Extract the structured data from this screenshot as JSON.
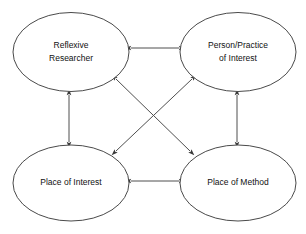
{
  "diagram": {
    "background_color": "#ffffff",
    "node_fill": "#ffffff",
    "node_stroke": "#4a4a4a",
    "connector_color": "#4f4f4f",
    "text_color": "#111111",
    "nodes": [
      {
        "id": "reflexive-researcher",
        "lines": [
          "Reflexive",
          "Researcher"
        ],
        "line1": "Reflexive",
        "line2": "Researcher",
        "cx": 71,
        "cy": 52,
        "rx": 58,
        "ry": 40
      },
      {
        "id": "person-practice-of-interest",
        "lines": [
          "Person/Practice",
          "of Interest"
        ],
        "line1": "Person/Practice",
        "line2": "of Interest",
        "cx": 238,
        "cy": 52,
        "rx": 58,
        "ry": 40
      },
      {
        "id": "place-of-interest",
        "lines": [
          "Place of Interest"
        ],
        "line1": "Place of Interest",
        "line2": "",
        "cx": 71,
        "cy": 183,
        "rx": 58,
        "ry": 38
      },
      {
        "id": "place-of-method",
        "lines": [
          "Place of Method"
        ],
        "line1": "Place of Method",
        "line2": "",
        "cx": 238,
        "cy": 183,
        "rx": 58,
        "ry": 38
      }
    ],
    "connectors": [
      {
        "id": "top-horizontal",
        "from": "reflexive-researcher",
        "to": "person-practice-of-interest",
        "direction": "bidirectional"
      },
      {
        "id": "bottom-horizontal",
        "from": "place-of-interest",
        "to": "place-of-method",
        "direction": "bidirectional"
      },
      {
        "id": "left-vertical",
        "from": "reflexive-researcher",
        "to": "place-of-interest",
        "direction": "bidirectional"
      },
      {
        "id": "right-vertical",
        "from": "person-practice-of-interest",
        "to": "place-of-method",
        "direction": "bidirectional"
      },
      {
        "id": "diagonal-researcher-to-method",
        "from": "reflexive-researcher",
        "to": "place-of-method",
        "direction": "bidirectional"
      },
      {
        "id": "diagonal-person-to-place-of-interest",
        "from": "person-practice-of-interest",
        "to": "place-of-interest",
        "direction": "bidirectional"
      }
    ]
  }
}
